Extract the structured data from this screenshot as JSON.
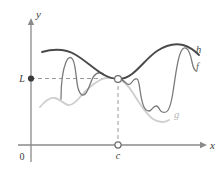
{
  "figure": {
    "background": "#ffffff"
  },
  "axes": {
    "x_label": "x",
    "y_label": "y",
    "origin_label": "0",
    "axis_color": "#8a8a8a",
    "x_axis_y": 145,
    "y_axis_x": 31,
    "x_axis_start": 18,
    "x_axis_end": 205,
    "y_axis_top": 18,
    "y_axis_bottom": 162
  },
  "markers": {
    "limit_tick_label": "L",
    "limit_tick_y": 78,
    "limit_dot_fill": "#3a3a3a",
    "c_tick_label": "c",
    "c_tick_x": 118,
    "open_circle_fill": "#ffffff",
    "open_circle_stroke": "#6e6e6e",
    "dashed_color": "#9a9a9a"
  },
  "curves": [
    {
      "name": "h",
      "label": "h",
      "role": "upper-bound",
      "color": "#4a4a4a",
      "width": 1.9,
      "label_x": 196,
      "label_y": 53,
      "path": "M 42,52 C 56,48 66,49 76,55 C 86,61 95,70 104,75 C 110,78 114,79 118,79 C 122,79 127,78 132,74 C 141,67 148,57 157,51 C 166,45 175,43 183,45 C 190,47 195,51 199,55"
    },
    {
      "name": "f",
      "label": "f",
      "role": "squeezed",
      "color": "#7a7a7a",
      "width": 1.3,
      "label_x": 196,
      "label_y": 70,
      "path": "M 61,99 C 61,88 62,72 66,62 C 68,57 71,56 73,60 C 76,66 76,80 78,88 C 80,95 83,97 86,93 C 89,89 91,80 94,76 C 97,72 101,72 105,75 C 110,78 114,79 118,79 C 121,79 124,81 126,83 C 128,85 130,85 132,82 C 134,79 135,78 137,79 C 139,80 139,84 140,90 C 141,97 142,103 144,107 C 146,111 149,112 151,110 C 153,108 154,106 156,106 C 158,106 159,108 160,110 C 161,112 163,113 166,112 C 169,111 171,105 173,92 C 175,79 177,62 180,54 C 182,48 185,46 188,50 C 190,53 191,57 192,62 C 193,67 194,70 196,71"
    },
    {
      "name": "g",
      "label": "g",
      "role": "lower-bound",
      "color": "#cfcfcf",
      "width": 1.9,
      "label_x": 174,
      "label_y": 118,
      "path": "M 40,107 C 45,101 50,97 55,98 C 60,99 64,104 68,105 C 72,106 76,102 81,96 C 87,89 93,84 100,80 C 107,76 113,78 118,79 C 123,80 128,85 133,93 C 140,104 146,114 153,119 C 159,123 164,123 169,120"
    }
  ],
  "colors": {
    "axis": "#8a8a8a",
    "dashed": "#9a9a9a",
    "h_curve": "#4a4a4a",
    "f_curve": "#7a7a7a",
    "g_curve": "#cfcfcf",
    "text": "#3a3a3a"
  }
}
